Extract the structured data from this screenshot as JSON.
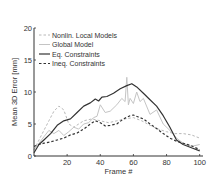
{
  "chart_data": {
    "type": "line",
    "title": "",
    "xlabel": "Frame #",
    "ylabel": "Mean 3D Error [mm]",
    "xlim": [
      0,
      102
    ],
    "ylim": [
      0,
      20
    ],
    "xticks": [
      20,
      40,
      60,
      80,
      100
    ],
    "yticks": [
      0,
      5,
      10,
      15,
      20
    ],
    "grid": false,
    "legend_position": "upper left",
    "series": [
      {
        "name": "Nonlin. Local Models",
        "style": "dashed",
        "color": "#b8b8b8",
        "x": [
          0,
          3,
          6,
          9,
          12,
          15,
          18,
          21,
          24,
          27,
          30,
          35,
          40,
          45,
          50,
          55,
          60,
          65,
          70,
          75,
          80,
          85,
          90,
          95,
          100
        ],
        "y": [
          1.0,
          2.5,
          4.0,
          5.5,
          7.0,
          7.8,
          7.2,
          5.0,
          4.5,
          5.0,
          5.5,
          5.8,
          5.5,
          5.2,
          5.5,
          5.8,
          6.0,
          5.5,
          4.8,
          4.2,
          3.8,
          3.5,
          3.5,
          3.3,
          2.8
        ]
      },
      {
        "name": "Global Model",
        "style": "solid",
        "color": "#c4c4c4",
        "x": [
          0,
          3,
          6,
          9,
          12,
          15,
          18,
          21,
          24,
          27,
          30,
          33,
          36,
          38,
          40,
          43,
          46,
          50,
          53,
          55,
          56,
          57,
          58,
          60,
          62,
          64,
          66,
          70,
          74,
          78,
          82,
          86,
          90,
          95,
          100
        ],
        "y": [
          1.0,
          2.0,
          3.0,
          4.0,
          3.5,
          4.0,
          3.2,
          3.8,
          4.5,
          4.2,
          5.0,
          5.2,
          6.0,
          6.2,
          8.0,
          6.8,
          7.0,
          8.0,
          9.0,
          8.5,
          12.3,
          8.0,
          9.0,
          8.2,
          10.0,
          8.5,
          9.0,
          6.5,
          7.2,
          5.0,
          4.0,
          2.8,
          2.0,
          1.5,
          1.8
        ]
      },
      {
        "name": "Eq. Constraints",
        "style": "solid",
        "color": "#333333",
        "x": [
          0,
          3,
          6,
          10,
          14,
          18,
          22,
          26,
          30,
          34,
          37,
          39,
          41,
          44,
          48,
          52,
          56,
          59,
          62,
          66,
          70,
          74,
          78,
          82,
          86,
          90,
          95,
          100
        ],
        "y": [
          0.5,
          1.8,
          2.5,
          3.5,
          4.8,
          5.5,
          5.8,
          6.8,
          7.8,
          8.3,
          8.9,
          8.6,
          9.2,
          9.3,
          9.8,
          10.5,
          11.0,
          11.3,
          10.8,
          9.8,
          8.8,
          7.8,
          6.3,
          4.5,
          2.5,
          1.8,
          1.3,
          0.8
        ]
      },
      {
        "name": "Ineq. Constraints",
        "style": "dashed",
        "color": "#333333",
        "x": [
          0,
          3,
          6,
          10,
          14,
          18,
          22,
          26,
          30,
          34,
          37,
          40,
          43,
          46,
          50,
          54,
          58,
          60,
          63,
          66,
          70,
          74,
          78,
          82,
          86,
          90,
          95,
          100
        ],
        "y": [
          1.5,
          1.8,
          2.0,
          2.2,
          2.5,
          2.8,
          3.3,
          3.6,
          4.2,
          5.0,
          5.5,
          5.2,
          4.7,
          4.8,
          5.0,
          5.8,
          6.3,
          6.4,
          6.1,
          5.8,
          5.0,
          4.3,
          3.5,
          2.8,
          2.3,
          2.0,
          1.6,
          1.0
        ]
      }
    ]
  }
}
